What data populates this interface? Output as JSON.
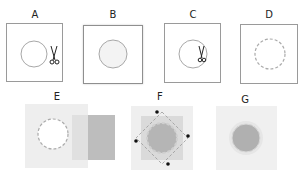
{
  "figure": {
    "panels": [
      {
        "id": "A",
        "label": "A",
        "description": "square with circle outline and scissors cutting at right edge"
      },
      {
        "id": "B",
        "label": "B",
        "description": "square with filled light circle"
      },
      {
        "id": "C",
        "label": "C",
        "description": "square with circle and scissors inside at right"
      },
      {
        "id": "D",
        "label": "D",
        "description": "square with dashed circle"
      },
      {
        "id": "E",
        "label": "E",
        "description": "light square with white dashed circle, overlapped by gray rectangles"
      },
      {
        "id": "F",
        "label": "F",
        "description": "gray square with diamond outline, four black corner dots and gray circle"
      },
      {
        "id": "G",
        "label": "G",
        "description": "light square with gray filled circle with halo"
      }
    ],
    "colors": {
      "frame": "#9a9a9a",
      "light_fill": "#eeeeee",
      "mid_gray": "#d4d4d4",
      "dark_gray": "#b8b8b8",
      "circle_gray": "#b0b0b0",
      "dash": "#aaaaaa",
      "dot": "#111111"
    }
  }
}
